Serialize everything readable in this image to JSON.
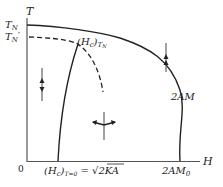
{
  "diagram": {
    "type": "phase-diagram",
    "axes": {
      "y_label": "T",
      "x_label": "H",
      "origin_label": "0"
    },
    "y_ticks": [
      {
        "label": "T",
        "sub": "N"
      },
      {
        "label": "T",
        "sub": "N",
        "prime": "′"
      }
    ],
    "x_ticks": {
      "hc_zero": {
        "main": "(H",
        "sub_c": "c",
        "close": ")",
        "sub_t": "T=0",
        "eq": " = √2KA"
      },
      "two_am0": {
        "main": "2AM",
        "sub": "0"
      }
    },
    "point_label": {
      "main": "(H",
      "sub_c": "c",
      "close": ")",
      "sub_t": "T",
      "sub_t2": "N"
    },
    "curve_label": "2AM",
    "regions": [
      {
        "name": "antiferromagnetic-parallel",
        "icon": "up-down-spins-icon"
      },
      {
        "name": "antiferromagnetic-perpendicular",
        "icon": "canted-spins-icon"
      },
      {
        "name": "paramagnetic",
        "icon": "aligned-spins-icon"
      }
    ],
    "colors": {
      "line": "#222222",
      "background": "#ffffff"
    }
  }
}
